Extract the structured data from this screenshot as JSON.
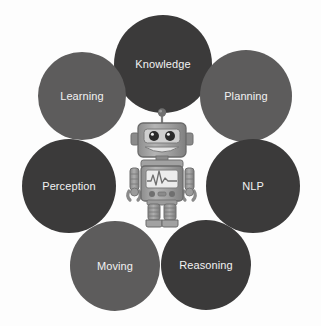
{
  "diagram": {
    "background_color": "#fdfdfd",
    "label_color": "#f2f2f2",
    "palette": {
      "dark": "#3b3a3a",
      "medium": "#5d5c5c"
    },
    "nodes": [
      {
        "id": "knowledge",
        "label": "Knowledge",
        "color": "#3b3a3a",
        "tone": "dark",
        "cx": 163,
        "cy": 64,
        "r": 49,
        "position": "top-center"
      },
      {
        "id": "learning",
        "label": "Learning",
        "color": "#5d5c5c",
        "tone": "medium",
        "cx": 82,
        "cy": 96,
        "r": 44,
        "position": "upper-left"
      },
      {
        "id": "planning",
        "label": "Planning",
        "color": "#5d5c5c",
        "tone": "medium",
        "cx": 246,
        "cy": 96,
        "r": 46,
        "position": "upper-right"
      },
      {
        "id": "perception",
        "label": "Perception",
        "color": "#3b3a3a",
        "tone": "dark",
        "cx": 69,
        "cy": 186,
        "r": 47,
        "position": "left"
      },
      {
        "id": "nlp",
        "label": "NLP",
        "color": "#3b3a3a",
        "tone": "dark",
        "cx": 253,
        "cy": 186,
        "r": 47,
        "position": "right"
      },
      {
        "id": "moving",
        "label": "Moving",
        "color": "#5d5c5c",
        "tone": "medium",
        "cx": 115,
        "cy": 266,
        "r": 45,
        "position": "lower-left"
      },
      {
        "id": "reasoning",
        "label": "Reasoning",
        "color": "#3b3a3a",
        "tone": "dark",
        "cx": 206,
        "cy": 265,
        "r": 45,
        "position": "lower-right"
      }
    ],
    "center_figure": {
      "name": "robot",
      "description": "Gray humanoid robot mascot",
      "body_color": "#9a9a9a",
      "body_shade": "#7d7d7d",
      "body_highlight": "#b9b9b9",
      "screen_color": "#e6e6e6",
      "waveform_color": "#6f6f6f",
      "eye_color": "#2b2b2b",
      "outline_color": "#6a6a6a",
      "cx": 162,
      "cy": 168,
      "width": 74,
      "height": 118
    }
  }
}
